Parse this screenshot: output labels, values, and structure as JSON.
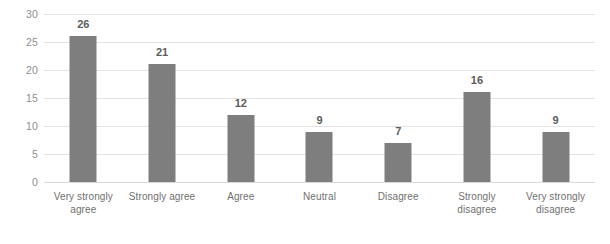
{
  "chart_data": {
    "type": "bar",
    "title": "",
    "subtitle": "",
    "xlabel": "",
    "ylabel": "",
    "categories": [
      "Very strongly agree",
      "Strongly agree",
      "Agree",
      "Neutral",
      "Disagree",
      "Strongly disagree",
      "Very strongly disagree"
    ],
    "values": [
      26,
      21,
      12,
      9,
      7,
      16,
      9
    ],
    "data_labels": [
      "26",
      "21",
      "12",
      "9",
      "7",
      "16",
      "9"
    ],
    "ylim": [
      0,
      30
    ],
    "yticks": [
      "0",
      "5",
      "10",
      "15",
      "20",
      "25",
      "30"
    ],
    "ytick_values": [
      0,
      5,
      10,
      15,
      20,
      25,
      30
    ],
    "grid": true,
    "grid_axis": "y",
    "legend": false,
    "legend_position": "none",
    "bar_color": "#7e7e7e",
    "gridline_color": "#e3e3e3",
    "axis_text_color": "#8e8e8e",
    "label_text_color": "#5c5c5c",
    "background_color": "#ffffff"
  }
}
